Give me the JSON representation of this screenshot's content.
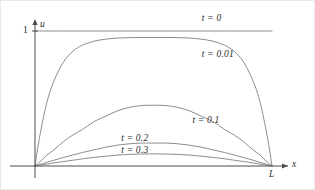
{
  "figure": {
    "background_color": "#ffffff",
    "line_color": "#808080",
    "axis_color": "#4d4d4d",
    "text_color": "#2b2b2b"
  },
  "axes": {
    "x_axis_label": "x",
    "y_axis_label": "u",
    "y_tick_label": "1",
    "x_end_label": "L",
    "x_range": [
      0,
      1
    ],
    "y_range": [
      0,
      1.18
    ]
  },
  "curves": [
    {
      "label": "t = 0",
      "t": 0,
      "peak": 1.0
    },
    {
      "label": "t = 0.01",
      "t": 0.01,
      "peak": 0.95
    },
    {
      "label": "t = 0.1",
      "t": 0.1,
      "peak": 0.45
    },
    {
      "label": "t = 0.2",
      "t": 0.2,
      "peak": 0.17
    },
    {
      "label": "t = 0.3",
      "t": 0.3,
      "peak": 0.09
    }
  ],
  "chart_data": {
    "type": "line",
    "title": "",
    "xlabel": "x",
    "ylabel": "u",
    "xlim": [
      0,
      1
    ],
    "ylim": [
      0,
      1.18
    ],
    "grid": false,
    "legend_position": "inline-annotations",
    "x_tick_labels": [
      "L"
    ],
    "y_tick_labels": [
      "1"
    ],
    "x": [
      0,
      0.02,
      0.05,
      0.08,
      0.12,
      0.16,
      0.2,
      0.25,
      0.3,
      0.35,
      0.4,
      0.45,
      0.5,
      0.55,
      0.6,
      0.65,
      0.7,
      0.75,
      0.8,
      0.84,
      0.88,
      0.92,
      0.95,
      0.98,
      1
    ],
    "series": [
      {
        "name": "t = 0",
        "values": [
          1,
          1,
          1,
          1,
          1,
          1,
          1,
          1,
          1,
          1,
          1,
          1,
          1,
          1,
          1,
          1,
          1,
          1,
          1,
          1,
          1,
          1,
          1,
          1,
          1
        ],
        "label_at": {
          "x": 0.78,
          "y": 1.09
        }
      },
      {
        "name": "t = 0.01",
        "values": [
          0,
          0.22,
          0.47,
          0.63,
          0.77,
          0.85,
          0.895,
          0.925,
          0.94,
          0.948,
          0.951,
          0.952,
          0.952,
          0.952,
          0.951,
          0.948,
          0.94,
          0.925,
          0.895,
          0.85,
          0.77,
          0.63,
          0.47,
          0.22,
          0
        ],
        "label_at": {
          "x": 0.78,
          "y": 0.82
        }
      },
      {
        "name": "t = 0.1",
        "values": [
          0,
          0.03,
          0.08,
          0.12,
          0.18,
          0.23,
          0.27,
          0.33,
          0.37,
          0.41,
          0.435,
          0.448,
          0.45,
          0.448,
          0.435,
          0.41,
          0.37,
          0.33,
          0.27,
          0.23,
          0.18,
          0.12,
          0.08,
          0.03,
          0
        ],
        "label_at": {
          "x": 0.74,
          "y": 0.33
        }
      },
      {
        "name": "t = 0.2",
        "values": [
          0,
          0.011,
          0.027,
          0.043,
          0.063,
          0.082,
          0.1,
          0.12,
          0.14,
          0.155,
          0.165,
          0.17,
          0.17,
          0.17,
          0.165,
          0.155,
          0.14,
          0.12,
          0.1,
          0.082,
          0.063,
          0.043,
          0.027,
          0.011,
          0
        ],
        "label_at": {
          "x": 0.44,
          "y": 0.2
        }
      },
      {
        "name": "t = 0.3",
        "values": [
          0,
          0.006,
          0.014,
          0.023,
          0.033,
          0.043,
          0.053,
          0.064,
          0.073,
          0.081,
          0.086,
          0.089,
          0.09,
          0.089,
          0.086,
          0.081,
          0.073,
          0.064,
          0.053,
          0.043,
          0.033,
          0.023,
          0.014,
          0.006,
          0
        ],
        "label_at": {
          "x": 0.44,
          "y": 0.11
        }
      }
    ]
  }
}
